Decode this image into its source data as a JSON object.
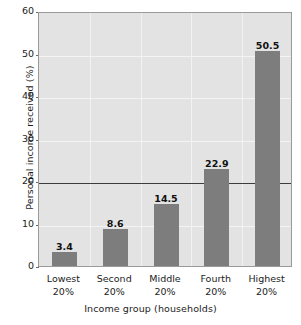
{
  "chart_data": {
    "type": "bar",
    "title": "",
    "xlabel": "Income group (households)",
    "ylabel": "Personal income received (%)",
    "categories": [
      "Lowest 20%",
      "Second 20%",
      "Middle 20%",
      "Fourth 20%",
      "Highest 20%"
    ],
    "category_lines": [
      [
        "Lowest",
        "20%"
      ],
      [
        "Second",
        "20%"
      ],
      [
        "Middle",
        "20%"
      ],
      [
        "Fourth",
        "20%"
      ],
      [
        "Highest",
        "20%"
      ]
    ],
    "values": [
      3.4,
      8.6,
      14.5,
      22.9,
      50.5
    ],
    "value_labels": [
      "3.4",
      "8.6",
      "14.5",
      "22.9",
      "50.5"
    ],
    "ylim": [
      0,
      60
    ],
    "yticks": [
      0,
      10,
      20,
      30,
      40,
      50,
      60
    ],
    "ytick_labels": [
      "0",
      "10",
      "20",
      "30",
      "40",
      "50",
      "60"
    ],
    "grid": true,
    "legend": "none",
    "reference_line": 20,
    "bar_color": "#7d7d7d",
    "plot_background": "#e3e3e3",
    "gridline_color": "#f2f2f2",
    "reference_line_color": "#3c3c3c",
    "text_color": "#1c1c1c"
  }
}
